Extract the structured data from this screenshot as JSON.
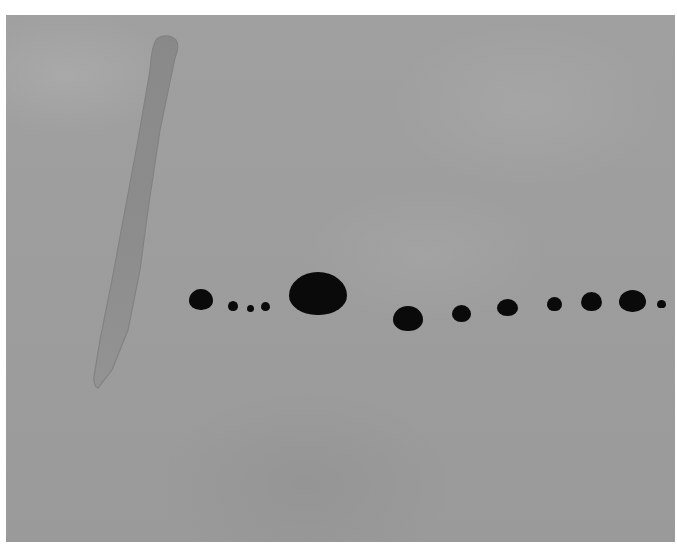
{
  "artwork": {
    "description": "Abstract painting: grey wash ground, a long diagonal pale-grey brushstroke at left, and a horizontal row of black dots of varying size across the center",
    "colors": {
      "border": "#ffffff",
      "ground": "#9c9c9c",
      "stroke": "#8a8a8a",
      "dots": "#0a0a0a"
    },
    "dots": [
      {
        "cx": 201,
        "cy": 299,
        "w": 24,
        "h": 21
      },
      {
        "cx": 233,
        "cy": 306,
        "w": 10,
        "h": 10
      },
      {
        "cx": 250,
        "cy": 308,
        "w": 7,
        "h": 7
      },
      {
        "cx": 265,
        "cy": 306,
        "w": 9,
        "h": 9
      },
      {
        "cx": 318,
        "cy": 293,
        "w": 58,
        "h": 43
      },
      {
        "cx": 408,
        "cy": 318,
        "w": 30,
        "h": 25
      },
      {
        "cx": 461,
        "cy": 313,
        "w": 19,
        "h": 17
      },
      {
        "cx": 507,
        "cy": 307,
        "w": 21,
        "h": 17
      },
      {
        "cx": 554,
        "cy": 304,
        "w": 15,
        "h": 14
      },
      {
        "cx": 591,
        "cy": 301,
        "w": 21,
        "h": 19
      },
      {
        "cx": 632,
        "cy": 301,
        "w": 27,
        "h": 22
      },
      {
        "cx": 661,
        "cy": 304,
        "w": 9,
        "h": 8
      }
    ]
  }
}
